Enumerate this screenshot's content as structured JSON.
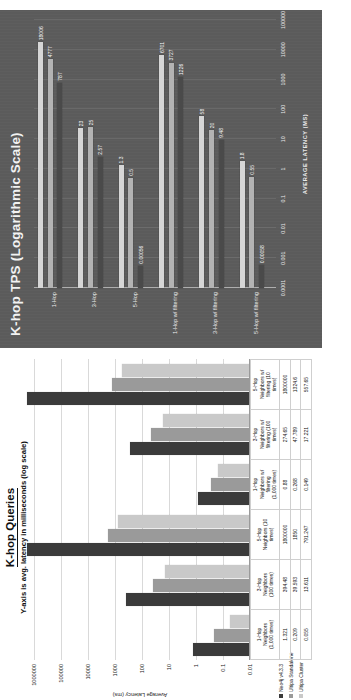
{
  "colors": {
    "neo4j": "#3b3b3b",
    "ultipa_standalone": "#9a9a9a",
    "ultipa_cluster": "#c9c9c9",
    "dark_bg": "#5b5b5b",
    "dark_series_1": "#d6d6d6",
    "dark_series_2": "#b3b3b3",
    "dark_series_3": "#4a4a4a"
  },
  "top_chart": {
    "title": "K-hop TPS (Logarithmic Scale)",
    "xlabel": "AVERAGE LATENCY (MS)",
    "xticks": [
      "0.0001",
      "0.001",
      "0.01",
      "0.1",
      "1",
      "10",
      "100",
      "1000",
      "10000",
      "100000"
    ]
  },
  "bottom_chart": {
    "title": "K-hop Queries",
    "subtitle": "Y-axis is avg. latency in milliseconds (log scale)",
    "ylabel": "Average Latency (ms)",
    "yticks": [
      "1000000",
      "100000",
      "10000",
      "1000",
      "100",
      "10",
      "1",
      "0.1",
      "0.01"
    ],
    "legend": [
      {
        "label": "Neo4j v4.3.3",
        "color": "#3b3b3b"
      },
      {
        "label": "Ultipa Standalone",
        "color": "#9a9a9a"
      },
      {
        "label": "Ultipa Cluster",
        "color": "#c9c9c9"
      }
    ]
  },
  "chart_data": [
    {
      "type": "bar",
      "orientation": "horizontal",
      "title": "K-hop TPS (Logarithmic Scale)",
      "xlabel": "AVERAGE LATENCY (MS)",
      "ylabel": "",
      "scale": "log",
      "xlim": [
        0.0001,
        100000
      ],
      "grid": true,
      "legend_position": "none",
      "categories": [
        "1-Hop",
        "3-Hop",
        "5-Hop",
        "1-Hop w/ filtering",
        "3-Hop w/ filtering",
        "5-Hop w/ filtering"
      ],
      "series": [
        {
          "name": "Ultipa Cluster",
          "color": "#d6d6d6",
          "values": [
            18006,
            23,
            1.3,
            6701,
            58,
            1.8
          ]
        },
        {
          "name": "Ultipa Standalone",
          "color": "#b3b3b3",
          "values": [
            4777,
            25,
            0.5,
            3727,
            20,
            0.55
          ]
        },
        {
          "name": "Neo4j v4.3.3",
          "color": "#4a4a4a",
          "values": [
            787,
            2.57,
            0.00056,
            1226,
            9.48,
            0.00058
          ]
        }
      ],
      "data_labels": [
        [
          "18006",
          "23",
          "1.3",
          "6701",
          "58",
          "1.8"
        ],
        [
          "4777",
          "25",
          "0.5",
          "3727",
          "20",
          "0.55"
        ],
        [
          "787",
          "2.57",
          "0.00056",
          "1226",
          "9.48",
          "0.00058"
        ]
      ]
    },
    {
      "type": "bar",
      "orientation": "vertical",
      "title": "K-hop Queries",
      "subtitle": "Y-axis is avg. latency in milliseconds (log scale)",
      "xlabel": "",
      "ylabel": "Average Latency (ms)",
      "scale": "log",
      "ylim": [
        0.01,
        1000000
      ],
      "grid": true,
      "legend_position": "bottom-left",
      "categories": [
        "1-Hop\nNeighbors\n(1,000 times)",
        "3-Hop\nNeighbors\n(100 times)",
        "5-Hop\nNeighbors (10\ntimes)",
        "1-Hop\nNeighbors w/\nfiltering\n(1,000 times)",
        "3-Hop\nNeighbors w/\nfiltering (100\ntimes)",
        "5-Hop\nNeighbors w/\nfiltering (10\ntimes)"
      ],
      "series": [
        {
          "name": "Neo4j v4.3.3",
          "color": "#3b3b3b",
          "values": [
            1.321,
            394.48,
            1800000,
            0.88,
            274.65,
            1800000
          ]
        },
        {
          "name": "Ultipa Standalone",
          "color": "#9a9a9a",
          "values": [
            0.209,
            39.593,
            1850,
            0.268,
            47.789,
            1324.6
          ]
        },
        {
          "name": "Ultipa Cluster",
          "color": "#c9c9c9",
          "values": [
            0.055,
            13.611,
            791.247,
            0.149,
            17.221,
            557.65
          ]
        }
      ],
      "table": {
        "columns": [
          "1-Hop\nNeighbors\n(1,000 times)",
          "3-Hop\nNeighbors\n(100 times)",
          "5-Hop\nNeighbors (10\ntimes)",
          "1-Hop\nNeighbors w/\nfiltering\n(1,000 times)",
          "3-Hop\nNeighbors w/\nfiltering (100\ntimes)",
          "5-Hop\nNeighbors w/\nfiltering (10\ntimes)"
        ],
        "rows": [
          {
            "label": "Neo4j v4.3.3",
            "values": [
              "1.321",
              "394.48",
              "1800000",
              "0.88",
              "274.65",
              "1800000"
            ]
          },
          {
            "label": "Ultipa Standalone",
            "values": [
              "0.209",
              "39.593",
              "1850",
              "0.268",
              "47.789",
              "1324.6"
            ]
          },
          {
            "label": "Ultipa Cluster",
            "values": [
              "0.055",
              "13.611",
              "791.247",
              "0.149",
              "17.221",
              "557.65"
            ]
          }
        ]
      }
    }
  ]
}
